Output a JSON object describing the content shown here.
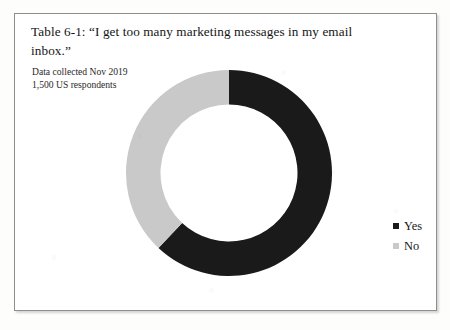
{
  "figure": {
    "title": "Table 6-1: “I get too many marketing messages in my email inbox.”",
    "subtitle_line_1": "Data collected Nov 2019",
    "subtitle_line_2": "1,500 US respondents"
  },
  "legend": {
    "items": [
      {
        "label": "Yes",
        "color": "#1a1a1a",
        "swatch_icon": "square-marker-icon"
      },
      {
        "label": "No",
        "color": "#c9c9c9",
        "swatch_icon": "square-marker-icon"
      }
    ]
  },
  "chart_data": {
    "type": "pie",
    "variant": "donut",
    "title": "Table 6-1: “I get too many marketing messages in my email inbox.”",
    "subtitle": "Data collected Nov 2019 — 1,500 US respondents",
    "categories": [
      "Yes",
      "No"
    ],
    "values": [
      62,
      38
    ],
    "value_unit": "percent",
    "colors": [
      "#1a1a1a",
      "#c9c9c9"
    ],
    "start_angle_deg": 0,
    "direction": "clockwise",
    "inner_radius_ratio": 0.665,
    "legend_position": "right",
    "grid": false,
    "data_labels": false,
    "sample_size": 1500,
    "collection_period": "Nov 2019",
    "population": "US respondents"
  },
  "geometry": {
    "center_x": 108,
    "center_y": 112,
    "outer_radius": 103,
    "inner_radius": 68.5
  }
}
